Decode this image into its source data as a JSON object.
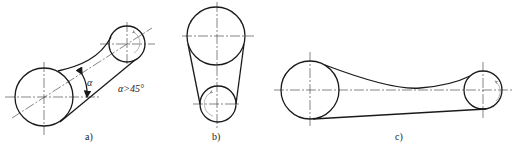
{
  "figure": {
    "panels": [
      {
        "id": "a",
        "label": "a)",
        "annotation_symbol": "α",
        "annotation_text": "α>45°",
        "description": "Inclined belt drive, large pulley lower-left, small pulley upper-right"
      },
      {
        "id": "b",
        "label": "b)",
        "description": "Vertical belt drive, large pulley on top, small pulley below"
      },
      {
        "id": "c",
        "label": "c)",
        "description": "Horizontal belt drive with slack upper side, large pulley left, small pulley right"
      }
    ],
    "colors": {
      "line": "#1a1a1a",
      "centerline": "#333333",
      "rotation_arrow": "#999999",
      "background": "#ffffff"
    }
  }
}
